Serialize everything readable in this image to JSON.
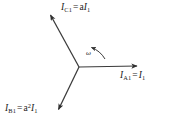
{
  "figure": {
    "type": "phasor-diagram",
    "title": "",
    "background_color": "#ffffff",
    "line_color": "#3a3a3a",
    "text_color": "#1a1a1a"
  },
  "labels": {
    "phasor_c1": {
      "symbol": "I",
      "subscript": "C1",
      "equals": "=",
      "coefficient": "a",
      "rhs_symbol": "I",
      "rhs_subscript": "1",
      "plain": "I_C1 = aI_1"
    },
    "phasor_a1": {
      "symbol": "I",
      "subscript": "A1",
      "equals": "=",
      "coefficient": "",
      "rhs_symbol": "I",
      "rhs_subscript": "1",
      "plain": "I_A1 = I_1"
    },
    "phasor_b1": {
      "symbol": "I",
      "subscript": "B1",
      "equals": "=",
      "coefficient": "a",
      "coefficient_exponent": "2",
      "rhs_symbol": "I",
      "rhs_subscript": "1",
      "plain": "I_B1 = a²I_1"
    },
    "rotation": {
      "symbol": "ω",
      "plain": "ω",
      "direction": "counterclockwise"
    }
  },
  "chart_data": {
    "type": "scatter",
    "xlabel": "",
    "ylabel": "",
    "origin_px": [
      79,
      67
    ],
    "series": [
      {
        "name": "I_A1 = I_1",
        "angle_deg": 0,
        "magnitude": 1.0,
        "tip_px": [
          140,
          66
        ],
        "label": "I_A1 = I_1"
      },
      {
        "name": "I_C1 = aI_1",
        "angle_deg": 120,
        "magnitude": 1.0,
        "tip_px": [
          48,
          11
        ],
        "label": "I_C1 = aI_1"
      },
      {
        "name": "I_B1 = a²I_1",
        "angle_deg": 240,
        "magnitude": 1.0,
        "tip_px": [
          57,
          113
        ],
        "label": "I_B1 = a²I_1"
      }
    ],
    "annotations": [
      {
        "name": "rotation-arc",
        "text": "ω",
        "direction": "counterclockwise",
        "center_px": [
          79,
          67
        ],
        "radius_px": 26
      }
    ],
    "legend": "none",
    "grid": false
  }
}
